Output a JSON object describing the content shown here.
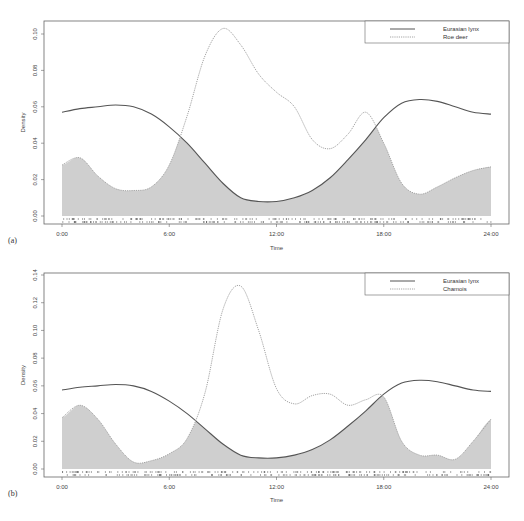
{
  "chart_data": [
    {
      "type": "line",
      "panel_label": "(a)",
      "title": "",
      "xlabel": "Time",
      "ylabel": "Density",
      "xlim": [
        0,
        24
      ],
      "ylim": [
        0,
        0.1
      ],
      "x_ticks": [
        "0:00",
        "6:00",
        "12:00",
        "18:00",
        "24:00"
      ],
      "y_ticks": [
        "0.00",
        "0.02",
        "0.04",
        "0.06",
        "0.08",
        "0.10"
      ],
      "grid": false,
      "legend_position": "top-right",
      "overlap_shaded": true,
      "x": [
        0,
        1,
        2,
        3,
        4,
        5,
        6,
        7,
        8,
        9,
        10,
        11,
        12,
        13,
        14,
        15,
        16,
        17,
        18,
        19,
        20,
        21,
        22,
        23,
        24
      ],
      "series": [
        {
          "name": "Eurasian lynx",
          "style": "solid",
          "values": [
            0.057,
            0.059,
            0.06,
            0.061,
            0.06,
            0.056,
            0.049,
            0.04,
            0.029,
            0.018,
            0.01,
            0.008,
            0.008,
            0.01,
            0.014,
            0.021,
            0.031,
            0.042,
            0.054,
            0.062,
            0.064,
            0.063,
            0.06,
            0.057,
            0.056
          ]
        },
        {
          "name": "Roe deer",
          "style": "dotted",
          "values": [
            0.028,
            0.032,
            0.022,
            0.015,
            0.014,
            0.016,
            0.028,
            0.055,
            0.088,
            0.103,
            0.094,
            0.078,
            0.068,
            0.06,
            0.042,
            0.037,
            0.045,
            0.057,
            0.04,
            0.018,
            0.012,
            0.016,
            0.021,
            0.025,
            0.027
          ]
        }
      ]
    },
    {
      "type": "line",
      "panel_label": "(b)",
      "title": "",
      "xlabel": "Time",
      "ylabel": "Density",
      "xlim": [
        0,
        24
      ],
      "ylim": [
        0,
        0.14
      ],
      "x_ticks": [
        "0:00",
        "6:00",
        "12:00",
        "18:00",
        "24:00"
      ],
      "y_ticks": [
        "0.00",
        "0.02",
        "0.04",
        "0.06",
        "0.08",
        "0.10",
        "0.12",
        "0.14"
      ],
      "grid": false,
      "legend_position": "top-right",
      "overlap_shaded": true,
      "x": [
        0,
        1,
        2,
        3,
        4,
        5,
        6,
        7,
        8,
        9,
        10,
        11,
        12,
        13,
        14,
        15,
        16,
        17,
        18,
        19,
        20,
        21,
        22,
        23,
        24
      ],
      "series": [
        {
          "name": "Eurasian lynx",
          "style": "solid",
          "values": [
            0.057,
            0.059,
            0.06,
            0.061,
            0.06,
            0.056,
            0.049,
            0.04,
            0.029,
            0.018,
            0.01,
            0.008,
            0.008,
            0.01,
            0.014,
            0.021,
            0.031,
            0.042,
            0.054,
            0.062,
            0.064,
            0.063,
            0.06,
            0.057,
            0.056
          ]
        },
        {
          "name": "Chamois",
          "style": "dotted",
          "values": [
            0.037,
            0.046,
            0.036,
            0.018,
            0.005,
            0.006,
            0.011,
            0.022,
            0.055,
            0.115,
            0.132,
            0.1,
            0.058,
            0.047,
            0.053,
            0.054,
            0.046,
            0.05,
            0.052,
            0.02,
            0.01,
            0.01,
            0.007,
            0.02,
            0.036
          ]
        }
      ]
    }
  ],
  "panels": [
    {
      "label": "(a)",
      "ylabel": "Density",
      "xlabel": "Time",
      "legend": [
        "Eurasian lynx",
        "Roe deer"
      ],
      "y_ticks": [
        "0.00",
        "0.02",
        "0.04",
        "0.06",
        "0.08",
        "0.10"
      ],
      "x_ticks": [
        "0:00",
        "6:00",
        "12:00",
        "18:00",
        "24:00"
      ]
    },
    {
      "label": "(b)",
      "ylabel": "Density",
      "xlabel": "Time",
      "legend": [
        "Eurasian lynx",
        "Chamois"
      ],
      "y_ticks": [
        "0.00",
        "0.02",
        "0.04",
        "0.06",
        "0.08",
        "0.10",
        "0.12",
        "0.14"
      ],
      "x_ticks": [
        "0:00",
        "6:00",
        "12:00",
        "18:00",
        "24:00"
      ]
    }
  ],
  "colors": {
    "lynx_line": "#555555",
    "prey_line": "#9a9a9a",
    "overlap_fill": "#cfcfcf",
    "axis": "#666666"
  }
}
